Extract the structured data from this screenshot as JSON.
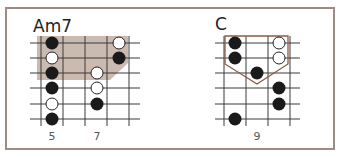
{
  "colors": {
    "frame": "#9c8c84",
    "grid": "#3a3a3a",
    "shade": "#cbbab0",
    "outline": "#8a5a4a",
    "dot_filled": "#1a1a1a",
    "dot_open_fill": "#ffffff",
    "dot_open_stroke": "#222222"
  },
  "diagrams": [
    {
      "name": "Am7",
      "name_pos": [
        33,
        18
      ],
      "strings_y": [
        43,
        58,
        73,
        88,
        104,
        119
      ],
      "string_x_range": [
        30,
        140
      ],
      "frets_x": [
        41,
        63,
        85,
        107,
        129
      ],
      "fret_y_range": [
        36,
        126
      ],
      "fret_labels": [
        {
          "label": "5",
          "x": 52,
          "y": 131
        },
        {
          "label": "7",
          "x": 97,
          "y": 131
        }
      ],
      "highlight": {
        "type": "shade",
        "points": [
          [
            37,
            36
          ],
          [
            128,
            36
          ],
          [
            128,
            63
          ],
          [
            110,
            80
          ],
          [
            37,
            80
          ]
        ]
      },
      "dots": [
        {
          "x": 52,
          "string": 0,
          "type": "filled"
        },
        {
          "x": 119,
          "string": 0,
          "type": "open"
        },
        {
          "x": 52,
          "string": 1,
          "type": "open"
        },
        {
          "x": 119,
          "string": 1,
          "type": "filled"
        },
        {
          "x": 52,
          "string": 2,
          "type": "filled"
        },
        {
          "x": 97,
          "string": 2,
          "type": "open"
        },
        {
          "x": 52,
          "string": 3,
          "type": "filled"
        },
        {
          "x": 97,
          "string": 3,
          "type": "open"
        },
        {
          "x": 52,
          "string": 4,
          "type": "open"
        },
        {
          "x": 97,
          "string": 4,
          "type": "filled"
        },
        {
          "x": 52,
          "string": 5,
          "type": "filled"
        }
      ]
    },
    {
      "name": "C",
      "name_pos": [
        215,
        16
      ],
      "strings_y": [
        43,
        58,
        73,
        88,
        104,
        119
      ],
      "string_x_range": [
        215,
        300
      ],
      "frets_x": [
        224,
        246,
        268,
        290
      ],
      "fret_y_range": [
        36,
        126
      ],
      "fret_labels": [
        {
          "label": "9",
          "x": 257,
          "y": 131
        }
      ],
      "highlight": {
        "type": "outline",
        "points": [
          [
            225,
            36
          ],
          [
            288,
            36
          ],
          [
            288,
            64
          ],
          [
            257,
            84
          ],
          [
            225,
            64
          ]
        ]
      },
      "dots": [
        {
          "x": 235,
          "string": 0,
          "type": "filled"
        },
        {
          "x": 279,
          "string": 0,
          "type": "open"
        },
        {
          "x": 235,
          "string": 1,
          "type": "filled"
        },
        {
          "x": 279,
          "string": 1,
          "type": "open"
        },
        {
          "x": 257,
          "string": 2,
          "type": "filled"
        },
        {
          "x": 279,
          "string": 3,
          "type": "filled"
        },
        {
          "x": 279,
          "string": 4,
          "type": "filled"
        },
        {
          "x": 235,
          "string": 5,
          "type": "filled"
        }
      ]
    }
  ]
}
